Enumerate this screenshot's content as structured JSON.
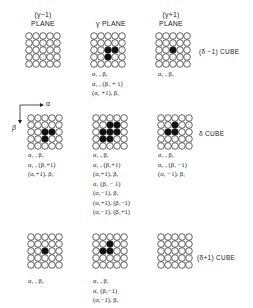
{
  "headers": {
    "prev_plane": [
      "(γ−1)",
      "PLANE"
    ],
    "cur_plane": [
      "γ PLANE"
    ],
    "next_plane": [
      "(γ+1)",
      "PLANE"
    ]
  },
  "axes": {
    "x": "α",
    "y": "β"
  },
  "cubes": [
    {
      "label": "(δ −1) CUBE"
    },
    {
      "label": "δ CUBE"
    },
    {
      "label": "(δ+1) CUBE"
    }
  ],
  "grids": [
    {
      "id": "r0c0",
      "size": 5,
      "filled": [],
      "labels": []
    },
    {
      "id": "r0c1",
      "size": 5,
      "filled": [
        [
          2,
          2
        ],
        [
          3,
          2
        ],
        [
          2,
          3
        ]
      ],
      "labels": [
        "α₁ , β₁",
        "α₁ , (β₁ + 1)",
        "(α₁ +1), β₁"
      ]
    },
    {
      "id": "r0c2",
      "size": 5,
      "filled": [
        [
          2,
          2
        ]
      ],
      "labels": [
        "α₁ , β₁"
      ]
    },
    {
      "id": "r1c0",
      "size": 5,
      "filled": [
        [
          2,
          2
        ],
        [
          3,
          2
        ],
        [
          2,
          3
        ]
      ],
      "labels": [
        "α₁ , β₁",
        "α₁ , (β₁+1)",
        "(α₁+1), β₁"
      ]
    },
    {
      "id": "r1c1",
      "size": 5,
      "filled": [
        [
          2,
          2
        ],
        [
          3,
          2
        ],
        [
          2,
          3
        ],
        [
          1,
          2
        ],
        [
          2,
          1
        ],
        [
          1,
          3
        ],
        [
          3,
          1
        ]
      ],
      "labels": [
        "α₁ , β₁",
        "α₁ , (β₁+1)",
        "(α₁+1), β₁",
        "α₁ (β₁ − 1)",
        "(α₁−1), β₁",
        "(α₁+1), (β₁−1)",
        "(α₁−1), (β₁+1)"
      ]
    },
    {
      "id": "r1c2",
      "size": 5,
      "filled": [
        [
          2,
          2
        ],
        [
          1,
          2
        ],
        [
          2,
          1
        ]
      ],
      "labels": [
        "α₁ , β₁",
        "α₁ , (β₁ −1)",
        "(α₁ −1), β₁"
      ]
    },
    {
      "id": "r2c0",
      "size": 5,
      "filled": [
        [
          2,
          2
        ]
      ],
      "labels": [
        "α₁ , β₁"
      ]
    },
    {
      "id": "r2c1",
      "size": 5,
      "filled": [
        [
          2,
          2
        ],
        [
          1,
          2
        ],
        [
          2,
          1
        ]
      ],
      "labels": [
        "α₁ , β₁",
        "α₁ (β₁−1)",
        "(α₁−1), β₁"
      ]
    },
    {
      "id": "r2c2",
      "size": 5,
      "filled": [],
      "labels": []
    }
  ],
  "colors": {
    "ink": "#222222",
    "fill": "#111111",
    "bg": "#ffffff"
  }
}
